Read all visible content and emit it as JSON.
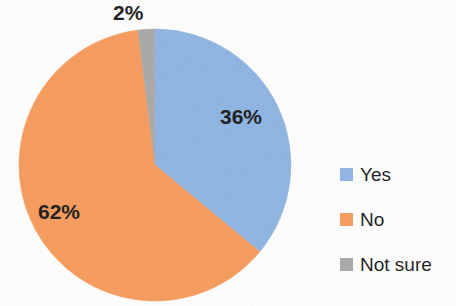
{
  "chart_data": {
    "type": "pie",
    "title": "",
    "subtitle": "",
    "xlabel": "",
    "ylabel": "",
    "grid": false,
    "legend_position": "right",
    "categories": [
      "Yes",
      "No",
      "Not sure"
    ],
    "values": [
      36,
      62,
      2
    ],
    "unit": "%",
    "data_labels": [
      "36%",
      "62%",
      "2%"
    ],
    "colors": [
      "#8eb4e3",
      "#f79a5b",
      "#a8a8a8"
    ],
    "slices": [
      {
        "label": "Yes",
        "value": 36,
        "data_label": "36%",
        "color": "#8eb4e3",
        "start_angle": 1,
        "end_angle": 130.6,
        "label_inside": true
      },
      {
        "label": "No",
        "value": 62,
        "data_label": "62%",
        "color": "#f79a5b",
        "start_angle": 130.6,
        "end_angle": 353.8,
        "label_inside": true
      },
      {
        "label": "Not sure",
        "value": 2,
        "data_label": "2%",
        "color": "#a8a8a8",
        "start_angle": 353.8,
        "end_angle": 361,
        "label_inside": false
      }
    ]
  },
  "pie": {
    "center_x": 155,
    "center_y": 165,
    "radius": 136,
    "labels": {
      "yes": "36%",
      "no": "62%",
      "not_sure": "2%"
    }
  },
  "legend": {
    "items": [
      {
        "label": "Yes",
        "color": "#8eb4e3"
      },
      {
        "label": "No",
        "color": "#f79a5b"
      },
      {
        "label": "Not sure",
        "color": "#a8a8a8"
      }
    ]
  },
  "theme": {
    "background": "#ffffff",
    "text_color": "#1a1a1a",
    "accent_blue": "#8eb4e3",
    "accent_orange": "#f79a5b",
    "accent_gray": "#a8a8a8"
  }
}
